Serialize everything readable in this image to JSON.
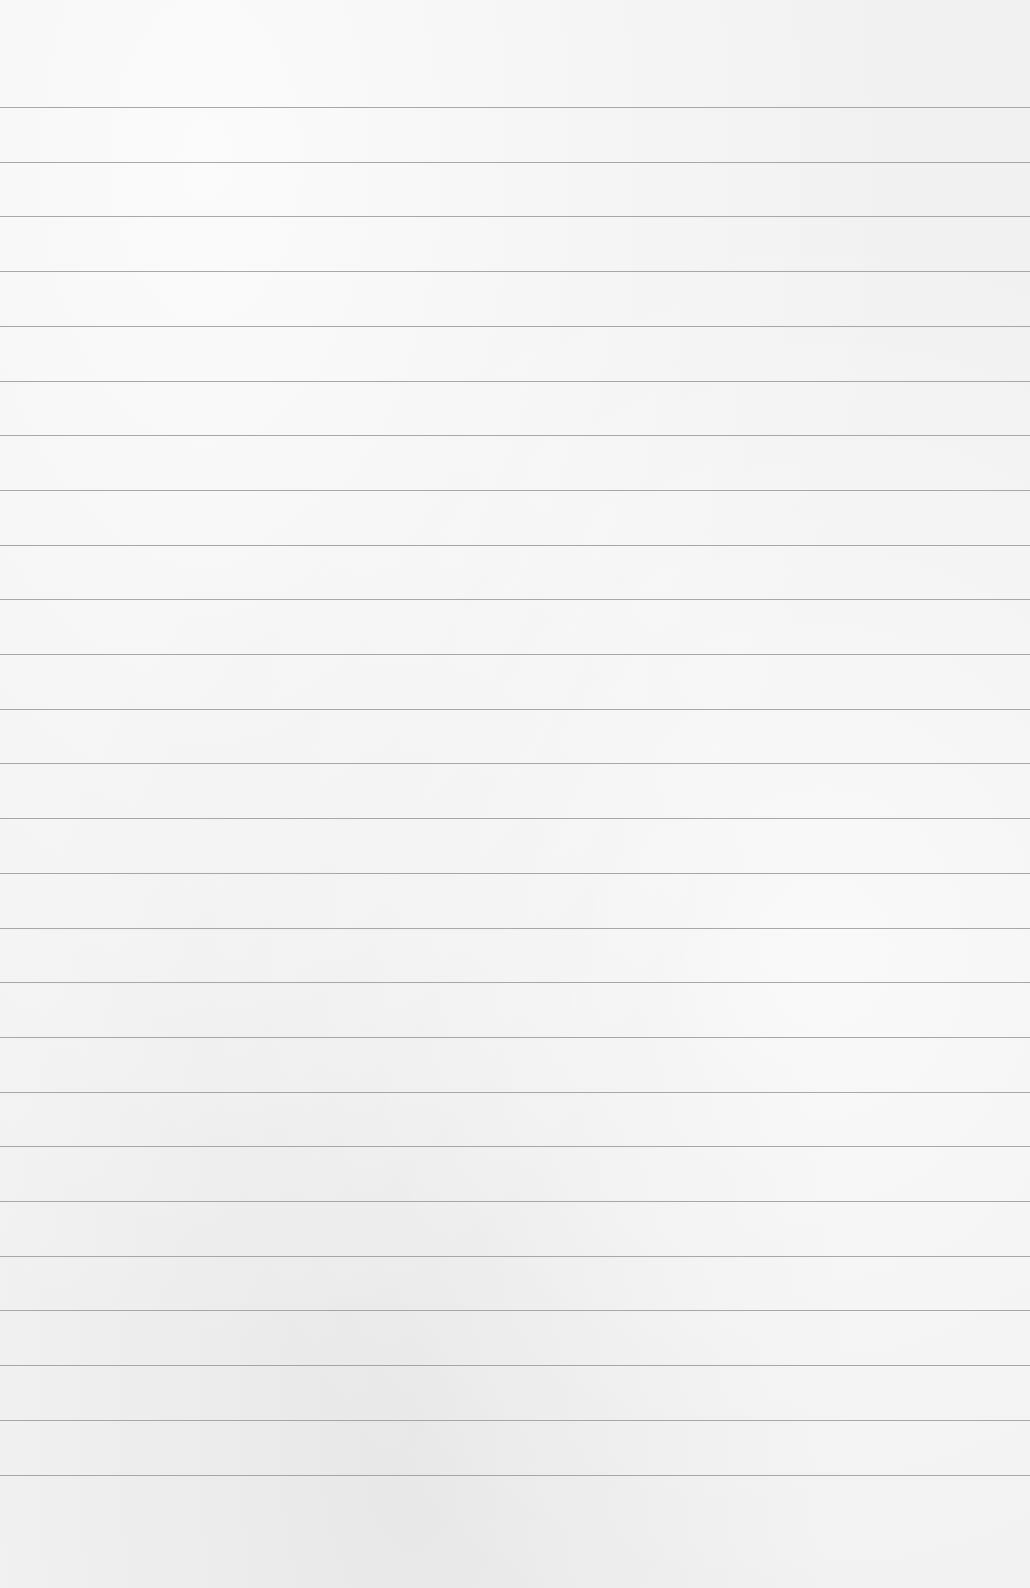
{
  "page": {
    "type": "ruled-paper",
    "background_color": "#f1f1f1",
    "line_color": "#9a9a9a",
    "first_line_y": 107,
    "line_spacing": 54.7,
    "line_count": 26
  }
}
